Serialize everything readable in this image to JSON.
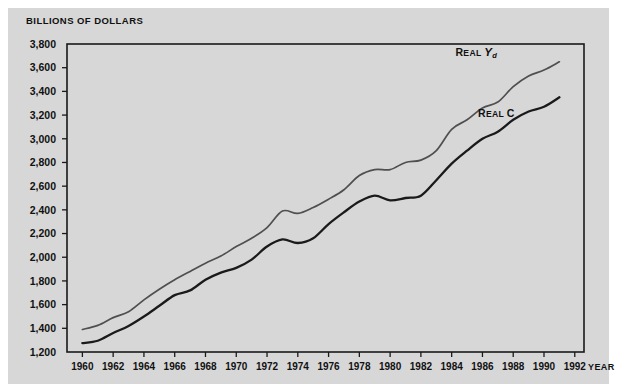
{
  "figure": {
    "background": "#ffffff",
    "panel_color": "#d7d7d7",
    "axis_color": "#1a1a1a"
  },
  "chart_data": {
    "type": "line",
    "title": "BILLIONS OF DOLLARS",
    "xlabel": "YEAR",
    "ylabel": "BILLIONS OF DOLLARS",
    "xlim": [
      1959,
      1992.6
    ],
    "ylim": [
      1200,
      3800
    ],
    "grid": false,
    "legend_position": "inline-right",
    "ytick_labels": [
      "3,800",
      "3,600",
      "3,400",
      "3,200",
      "3,000",
      "2,800",
      "2,600",
      "2,400",
      "2,200",
      "2,000",
      "1,800",
      "1,600",
      "1,400",
      "1,200"
    ],
    "ytick_values": [
      3800,
      3600,
      3400,
      3200,
      3000,
      2800,
      2600,
      2400,
      2200,
      2000,
      1800,
      1600,
      1400,
      1200
    ],
    "xtick_labels": [
      "1960",
      "1962",
      "1964",
      "1966",
      "1968",
      "1970",
      "1972",
      "1974",
      "1976",
      "1978",
      "1980",
      "1982",
      "1984",
      "1986",
      "1988",
      "1990",
      "1992"
    ],
    "xtick_values": [
      1960,
      1962,
      1964,
      1966,
      1968,
      1970,
      1972,
      1974,
      1976,
      1978,
      1980,
      1982,
      1984,
      1986,
      1988,
      1990,
      1992
    ],
    "x": [
      1960,
      1961,
      1962,
      1963,
      1964,
      1965,
      1966,
      1967,
      1968,
      1969,
      1970,
      1971,
      1972,
      1973,
      1974,
      1975,
      1976,
      1977,
      1978,
      1979,
      1980,
      1981,
      1982,
      1983,
      1984,
      1985,
      1986,
      1987,
      1988,
      1989,
      1990,
      1991
    ],
    "series": [
      {
        "name": "Real Yd",
        "label_plain": "REAL Yd",
        "color": "#4f4f4f",
        "width": 1.7,
        "values": [
          1390,
          1425,
          1490,
          1540,
          1640,
          1730,
          1810,
          1880,
          1950,
          2010,
          2090,
          2160,
          2250,
          2390,
          2370,
          2420,
          2490,
          2570,
          2690,
          2740,
          2740,
          2800,
          2820,
          2900,
          3080,
          3160,
          3260,
          3310,
          3440,
          3530,
          3580,
          3650
        ]
      },
      {
        "name": "Real C",
        "label_plain": "REAL C",
        "color": "#1a1a1a",
        "width": 2.3,
        "values": [
          1275,
          1295,
          1360,
          1420,
          1500,
          1590,
          1680,
          1720,
          1810,
          1870,
          1910,
          1980,
          2090,
          2150,
          2120,
          2160,
          2280,
          2380,
          2470,
          2520,
          2480,
          2500,
          2520,
          2650,
          2790,
          2900,
          3000,
          3060,
          3160,
          3230,
          3270,
          3350
        ]
      }
    ],
    "annotations": [
      {
        "text": "REAL Yd",
        "x": 1985.6,
        "y": 3700
      },
      {
        "text": "REAL C",
        "x": 1986.9,
        "y": 3180
      }
    ]
  }
}
